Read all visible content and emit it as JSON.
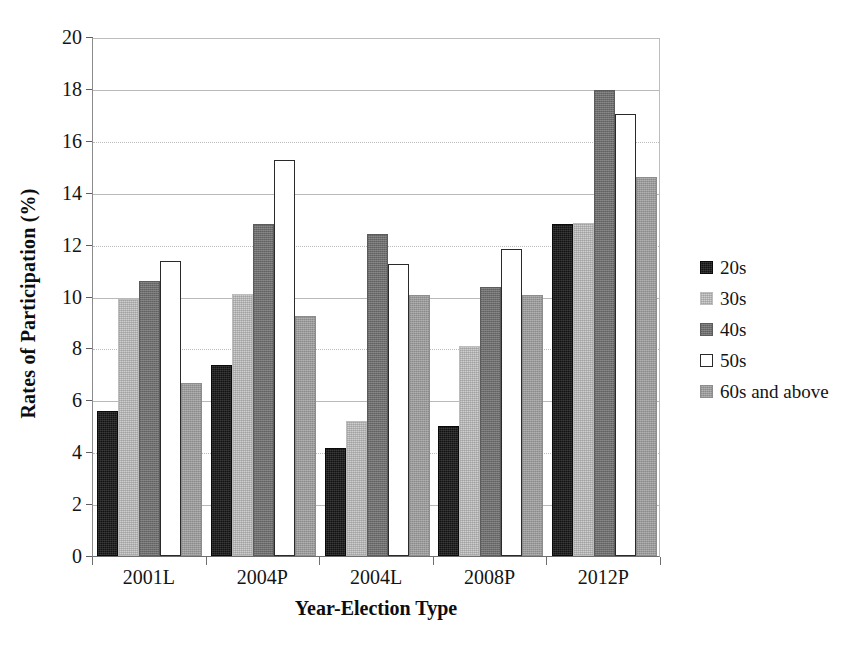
{
  "chart_data": {
    "type": "bar",
    "title": "",
    "xlabel": "Year-Election Type",
    "ylabel": "Rates of Participation (%)",
    "categories": [
      "2001L",
      "2004P",
      "2004L",
      "2008P",
      "2012P"
    ],
    "ylim": [
      0,
      20
    ],
    "yticks": [
      0,
      2,
      4,
      6,
      8,
      10,
      12,
      14,
      16,
      18,
      20
    ],
    "grid": true,
    "legend_position": "right",
    "series": [
      {
        "name": "20s",
        "values": [
          5.6,
          7.35,
          4.15,
          5.0,
          12.8
        ]
      },
      {
        "name": "30s",
        "values": [
          9.9,
          10.1,
          5.2,
          8.1,
          12.85
        ]
      },
      {
        "name": "40s",
        "values": [
          10.6,
          12.8,
          12.4,
          10.35,
          17.95
        ]
      },
      {
        "name": "50s",
        "values": [
          11.35,
          15.25,
          11.25,
          11.85,
          17.05
        ]
      },
      {
        "name": "60s and above",
        "values": [
          6.65,
          9.25,
          10.05,
          10.05,
          14.6
        ]
      }
    ]
  },
  "legend": {
    "items": [
      {
        "label": "20s",
        "swatch": "black-square",
        "color": "#121212"
      },
      {
        "label": "30s",
        "swatch": "light-gray-square",
        "color": "#cfcfcf"
      },
      {
        "label": "40s",
        "swatch": "dark-gray-square",
        "color": "#6e6e6e"
      },
      {
        "label": "50s",
        "swatch": "white-square-outline",
        "color": "#ffffff"
      },
      {
        "label": "60s and above",
        "swatch": "medium-gray-square",
        "color": "#9a9a9a"
      }
    ]
  },
  "axes": {
    "y_ticks": [
      "20",
      "18",
      "16",
      "14",
      "12",
      "10",
      "8",
      "6",
      "4",
      "2",
      "0"
    ],
    "y_title": "Rates of Participation (%)",
    "x_title": "Year-Election Type",
    "x_ticks": [
      "2001L",
      "2004P",
      "2004L",
      "2008P",
      "2012P"
    ]
  }
}
